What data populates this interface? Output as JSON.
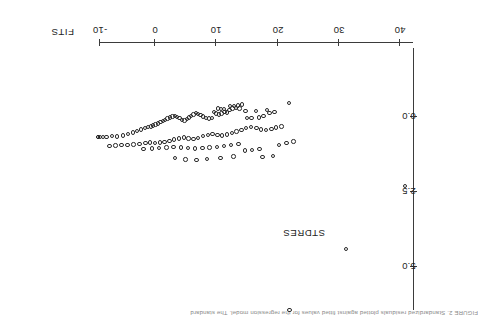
{
  "figure": {
    "caption": "FIGURE 2.   Standardized residuals plotted against fitted values for the regression model. The standard",
    "orientation_degrees": 180
  },
  "chart_data": {
    "type": "scatter",
    "title": "",
    "xlabel": "FITS",
    "ylabel": "STDRES",
    "xticks": [
      -10,
      0,
      10,
      20,
      30,
      40
    ],
    "xticklabels": [
      "-10",
      "0",
      "10",
      "20",
      "30",
      "40"
    ],
    "yticks": [
      0.0,
      2.5,
      5.0
    ],
    "yticklabels": [
      "0.0",
      "2.5",
      "5.0"
    ],
    "xlim": [
      -12,
      47
    ],
    "ylim": [
      -0.7,
      6.2
    ],
    "grid": false,
    "legend": false,
    "marker": "open-circle",
    "points": [
      [
        21.4,
        -0.48
      ],
      [
        17.8,
        -0.25
      ],
      [
        15.9,
        -0.22
      ],
      [
        14.2,
        -0.22
      ],
      [
        13.2,
        -0.3
      ],
      [
        12.6,
        -0.31
      ],
      [
        12.0,
        -0.3
      ],
      [
        11.5,
        -0.24
      ],
      [
        11.1,
        -0.16
      ],
      [
        11.6,
        -0.37
      ],
      [
        12.3,
        -0.38
      ],
      [
        12.9,
        -0.4
      ],
      [
        13.6,
        -0.43
      ],
      [
        10.7,
        -0.17
      ],
      [
        10.2,
        -0.13
      ],
      [
        9.8,
        -0.1
      ],
      [
        9.3,
        -0.13
      ],
      [
        8.9,
        -0.17
      ],
      [
        10.6,
        -0.27
      ],
      [
        10.1,
        -0.27
      ],
      [
        9.6,
        -0.3
      ],
      [
        19.0,
        -0.17
      ],
      [
        18.2,
        -0.14
      ],
      [
        17.2,
        -0.04
      ],
      [
        16.4,
        0.0
      ],
      [
        15.2,
        0.03
      ],
      [
        14.4,
        0.01
      ],
      [
        8.6,
        0.02
      ],
      [
        8.1,
        0.04
      ],
      [
        7.6,
        0.03
      ],
      [
        7.1,
        -0.03
      ],
      [
        6.7,
        -0.09
      ],
      [
        6.3,
        -0.12
      ],
      [
        5.9,
        -0.14
      ],
      [
        5.5,
        -0.1
      ],
      [
        5.1,
        -0.05
      ],
      [
        4.8,
        0.0
      ],
      [
        4.4,
        0.05
      ],
      [
        4.0,
        0.1
      ],
      [
        3.6,
        0.08
      ],
      [
        3.2,
        0.03
      ],
      [
        2.8,
        -0.02
      ],
      [
        2.4,
        -0.05
      ],
      [
        2.0,
        -0.03
      ],
      [
        1.6,
        0.0
      ],
      [
        1.2,
        0.04
      ],
      [
        0.8,
        0.08
      ],
      [
        0.4,
        0.12
      ],
      [
        0.0,
        0.16
      ],
      [
        -0.4,
        0.2
      ],
      [
        -0.8,
        0.24
      ],
      [
        -1.2,
        0.27
      ],
      [
        -1.6,
        0.3
      ],
      [
        -2.1,
        0.33
      ],
      [
        -2.6,
        0.36
      ],
      [
        -3.2,
        0.4
      ],
      [
        -3.9,
        0.45
      ],
      [
        -4.6,
        0.5
      ],
      [
        -5.4,
        0.55
      ],
      [
        -6.3,
        0.6
      ],
      [
        -7.2,
        0.64
      ],
      [
        -8.1,
        0.62
      ],
      [
        -9.0,
        0.65
      ],
      [
        -9.6,
        0.66
      ],
      [
        -10.1,
        0.66
      ],
      [
        20.2,
        0.3
      ],
      [
        19.3,
        0.34
      ],
      [
        18.5,
        0.38
      ],
      [
        17.6,
        0.42
      ],
      [
        16.8,
        0.4
      ],
      [
        16.0,
        0.36
      ],
      [
        15.1,
        0.33
      ],
      [
        14.3,
        0.36
      ],
      [
        13.5,
        0.42
      ],
      [
        12.7,
        0.47
      ],
      [
        11.9,
        0.52
      ],
      [
        11.1,
        0.57
      ],
      [
        10.3,
        0.6
      ],
      [
        9.5,
        0.58
      ],
      [
        8.7,
        0.55
      ],
      [
        7.9,
        0.58
      ],
      [
        7.1,
        0.63
      ],
      [
        6.3,
        0.68
      ],
      [
        5.5,
        0.72
      ],
      [
        4.7,
        0.7
      ],
      [
        3.9,
        0.67
      ],
      [
        3.1,
        0.7
      ],
      [
        2.3,
        0.74
      ],
      [
        1.5,
        0.78
      ],
      [
        0.7,
        0.82
      ],
      [
        -0.1,
        0.84
      ],
      [
        -0.9,
        0.86
      ],
      [
        -1.7,
        0.84
      ],
      [
        -2.5,
        0.86
      ],
      [
        -3.5,
        0.88
      ],
      [
        -4.5,
        0.9
      ],
      [
        -5.5,
        0.92
      ],
      [
        -6.5,
        0.93
      ],
      [
        -7.5,
        0.94
      ],
      [
        -8.5,
        0.95
      ],
      [
        13.0,
        0.88
      ],
      [
        11.8,
        0.92
      ],
      [
        10.6,
        0.96
      ],
      [
        9.4,
        0.98
      ],
      [
        8.2,
        1.0
      ],
      [
        7.0,
        1.02
      ],
      [
        5.8,
        1.04
      ],
      [
        4.6,
        1.02
      ],
      [
        3.4,
        1.0
      ],
      [
        2.2,
        0.98
      ],
      [
        1.0,
        1.0
      ],
      [
        -0.2,
        1.02
      ],
      [
        -1.4,
        1.04
      ],
      [
        -2.8,
        1.06
      ],
      [
        16.5,
        1.05
      ],
      [
        15.3,
        1.08
      ],
      [
        14.1,
        1.1
      ],
      [
        19.8,
        0.92
      ],
      [
        21.0,
        0.86
      ],
      [
        22.2,
        0.8
      ],
      [
        12.2,
        1.3
      ],
      [
        10.0,
        1.35
      ],
      [
        7.8,
        1.38
      ],
      [
        6.0,
        1.42
      ],
      [
        4.2,
        1.4
      ],
      [
        2.4,
        1.36
      ],
      [
        18.8,
        1.28
      ],
      [
        17.0,
        1.32
      ],
      [
        40.8,
        2.28
      ],
      [
        30.9,
        4.38
      ],
      [
        21.5,
        6.42
      ]
    ],
    "highlighted_points": [
      [
        -10.4,
        0.66
      ]
    ],
    "n_points": 131
  }
}
